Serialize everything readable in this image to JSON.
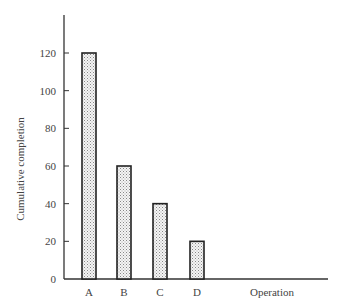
{
  "chart_data": {
    "type": "bar",
    "title": "",
    "xlabel": "Operation",
    "ylabel": "Cumulative completion",
    "categories": [
      "A",
      "B",
      "C",
      "D"
    ],
    "values": [
      120,
      60,
      40,
      20
    ],
    "ylim": [
      0,
      140
    ],
    "yticks": [
      0,
      20,
      40,
      60,
      80,
      100,
      120
    ],
    "grid": false,
    "legend": null,
    "bar_fill": "stippled light gray",
    "colors": {
      "bar_fill": "#e4e4e4",
      "bar_stroke": "#222222",
      "axis": "#333333"
    }
  }
}
